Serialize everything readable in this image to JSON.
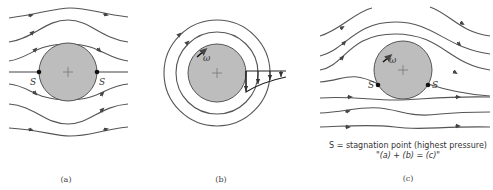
{
  "figure": {
    "panel_a": {
      "caption": "(a)",
      "stagnation_labels": [
        "S",
        "S"
      ],
      "description": "Uniform flow past a cylinder, symmetric streamlines"
    },
    "panel_b": {
      "caption": "(b)",
      "rotation_label": "ω",
      "description": "Rotating cylinder with circular streamlines and velocity profile"
    },
    "panel_c": {
      "caption": "(c)",
      "stagnation_labels": [
        "S",
        "S"
      ],
      "rotation_label": "ω",
      "description": "Combined flow: uniform flow plus circulation"
    },
    "legend_line1": "S = stagnation point (highest pressure)",
    "legend_line2": "\"(a) + (b) = (c)\""
  },
  "colors": {
    "cylinder_fill": "#bdbdbd",
    "stroke": "#555555",
    "background": "#ffffff"
  }
}
